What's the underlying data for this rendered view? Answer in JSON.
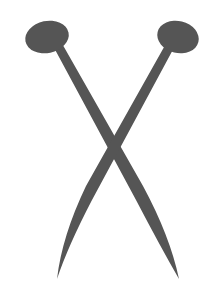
{
  "image": {
    "subject": "knitting-needles-icon",
    "description": "Two crossed knitting needles",
    "colors": {
      "background": "#ffffff",
      "needle": "#555555"
    }
  }
}
